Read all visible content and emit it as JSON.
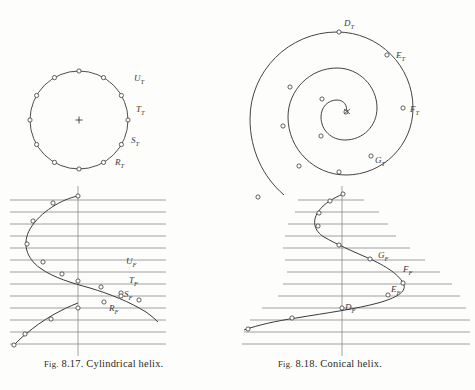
{
  "page": {
    "background": "#fdfdfc",
    "ink": "#3a3a3a",
    "construction_line_color": "#6f6f6f"
  },
  "figures": [
    {
      "id": "fig-8-17",
      "caption_line1": "Fig. 8.17. Cylindrical",
      "caption_line2": "helix.",
      "caption_prefix": "Fig.",
      "caption_number": "8.17.",
      "caption_text": "Cylindrical helix.",
      "top_view": {
        "name": "circle-top-view",
        "center_x": 79,
        "center_y": 120,
        "radius": 49,
        "center_mark": "cross",
        "point_count": 12,
        "labels": [
          {
            "text": "U",
            "sub": "T",
            "x": 134,
            "y": 79
          },
          {
            "text": "T",
            "sub": "T",
            "x": 136,
            "y": 110
          },
          {
            "text": "S",
            "sub": "T",
            "x": 131,
            "y": 141
          },
          {
            "text": "R",
            "sub": "T",
            "x": 115,
            "y": 163
          }
        ]
      },
      "front_view": {
        "name": "sine-front-view",
        "axis_x": 78,
        "top": 196,
        "bottom": 348,
        "line_left": 10,
        "line_right": 166,
        "line_count": 13,
        "amplitude": 56,
        "labels": [
          {
            "text": "U",
            "sub": "F",
            "x": 126,
            "y": 262
          },
          {
            "text": "T",
            "sub": "F",
            "x": 129,
            "y": 281
          },
          {
            "text": "S",
            "sub": "F",
            "x": 124,
            "y": 295
          },
          {
            "text": "R",
            "sub": "F",
            "x": 109,
            "y": 309
          }
        ]
      }
    },
    {
      "id": "fig-8-18",
      "caption_line1": "Fig. 8.18. Conical helix.",
      "caption_prefix": "Fig.",
      "caption_number": "8.18.",
      "caption_text": "Conical helix.",
      "top_view": {
        "name": "spiral-top-view",
        "center_x": 338,
        "center_y": 113,
        "start_radius": 8,
        "end_radius": 88,
        "turns": 2,
        "labels": [
          {
            "text": "D",
            "sub": "T",
            "x": 344,
            "y": 24
          },
          {
            "text": "E",
            "sub": "T",
            "x": 396,
            "y": 56
          },
          {
            "text": "F",
            "sub": "T",
            "x": 410,
            "y": 110
          },
          {
            "text": "G",
            "sub": "T",
            "x": 375,
            "y": 161
          }
        ]
      },
      "front_view": {
        "name": "damped-sine-front-view",
        "axis_x": 342,
        "top": 196,
        "bottom": 348,
        "line_left_min": 285,
        "line_right_max": 470,
        "line_count": 13,
        "amplitude_max": 60,
        "labels": [
          {
            "text": "G",
            "sub": "F",
            "x": 378,
            "y": 256
          },
          {
            "text": "F",
            "sub": "F",
            "x": 402,
            "y": 270
          },
          {
            "text": "E",
            "sub": "F",
            "x": 391,
            "y": 290
          },
          {
            "text": "D",
            "sub": "F",
            "x": 345,
            "y": 308
          }
        ]
      }
    }
  ]
}
